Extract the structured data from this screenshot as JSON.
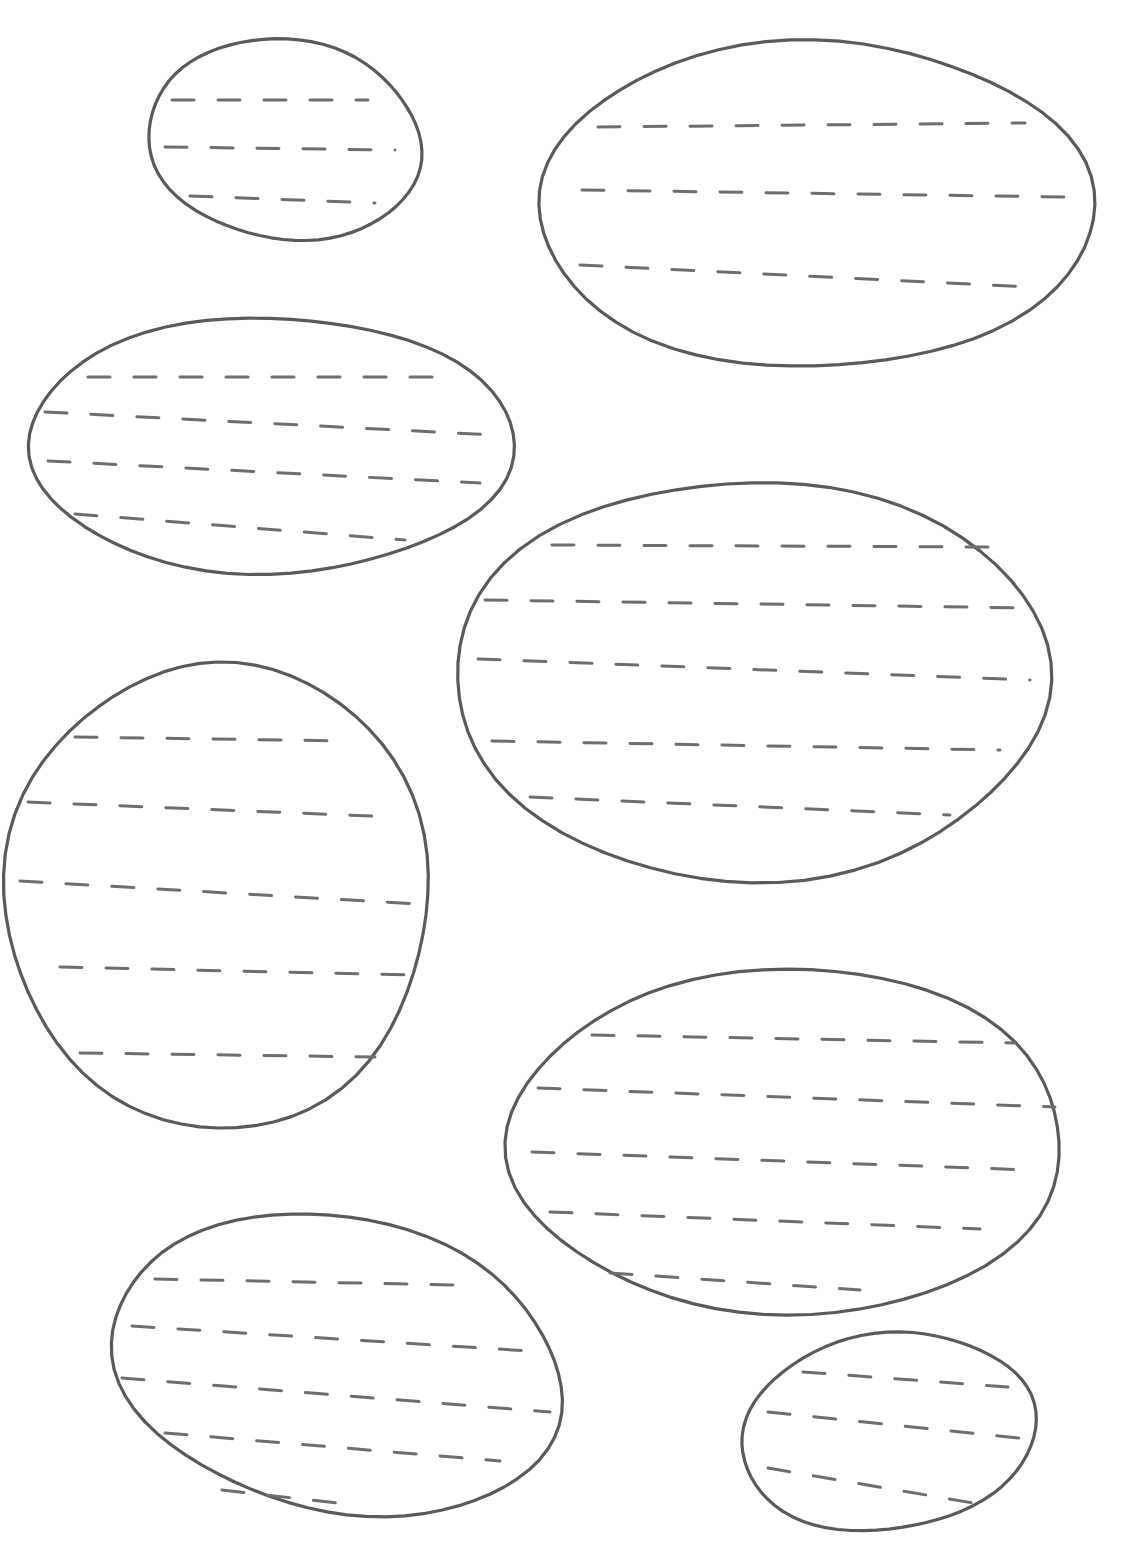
{
  "worksheet": {
    "type": "pre-writing tracing practice",
    "stroke_color": "#5a5a5a",
    "dash_color": "#6e6e6e",
    "background": "#ffffff",
    "shapes": [
      {
        "name": "oval-1",
        "cx": 285,
        "cy": 140,
        "rx": 137,
        "ry": 100,
        "rot": 8,
        "lines": [
          {
            "x1": 172,
            "y1": 100,
            "x2": 368,
            "y2": 100
          },
          {
            "x1": 165,
            "y1": 147,
            "x2": 395,
            "y2": 150
          },
          {
            "x1": 190,
            "y1": 196,
            "x2": 375,
            "y2": 203
          }
        ]
      },
      {
        "name": "oval-2",
        "cx": 815,
        "cy": 205,
        "rx": 278,
        "ry": 163,
        "rot": 0,
        "lines": [
          {
            "x1": 598,
            "y1": 127,
            "x2": 1025,
            "y2": 123
          },
          {
            "x1": 582,
            "y1": 190,
            "x2": 1065,
            "y2": 197
          },
          {
            "x1": 580,
            "y1": 265,
            "x2": 1030,
            "y2": 287
          }
        ]
      },
      {
        "name": "oval-3",
        "cx": 270,
        "cy": 445,
        "rx": 243,
        "ry": 128,
        "rot": 0,
        "lines": [
          {
            "x1": 88,
            "y1": 377,
            "x2": 450,
            "y2": 377
          },
          {
            "x1": 45,
            "y1": 412,
            "x2": 495,
            "y2": 435
          },
          {
            "x1": 48,
            "y1": 461,
            "x2": 480,
            "y2": 483
          },
          {
            "x1": 75,
            "y1": 514,
            "x2": 405,
            "y2": 540
          }
        ]
      },
      {
        "name": "oval-4",
        "cx": 752,
        "cy": 680,
        "rx": 297,
        "ry": 200,
        "rot": 0,
        "lines": [
          {
            "x1": 552,
            "y1": 545,
            "x2": 990,
            "y2": 547
          },
          {
            "x1": 485,
            "y1": 600,
            "x2": 1030,
            "y2": 608
          },
          {
            "x1": 478,
            "y1": 659,
            "x2": 1030,
            "y2": 680
          },
          {
            "x1": 492,
            "y1": 741,
            "x2": 1000,
            "y2": 750
          },
          {
            "x1": 530,
            "y1": 797,
            "x2": 950,
            "y2": 815
          }
        ]
      },
      {
        "name": "oval-5",
        "cx": 218,
        "cy": 895,
        "rx": 212,
        "ry": 233,
        "rot": 0,
        "lines": [
          {
            "x1": 75,
            "y1": 737,
            "x2": 350,
            "y2": 741
          },
          {
            "x1": 28,
            "y1": 802,
            "x2": 395,
            "y2": 817
          },
          {
            "x1": 20,
            "y1": 881,
            "x2": 418,
            "y2": 904
          },
          {
            "x1": 60,
            "y1": 967,
            "x2": 410,
            "y2": 975
          },
          {
            "x1": 80,
            "y1": 1053,
            "x2": 375,
            "y2": 1057
          }
        ]
      },
      {
        "name": "oval-6",
        "cx": 787,
        "cy": 1142,
        "rx": 277,
        "ry": 173,
        "rot": 0,
        "lines": [
          {
            "x1": 592,
            "y1": 1035,
            "x2": 1015,
            "y2": 1043
          },
          {
            "x1": 538,
            "y1": 1088,
            "x2": 1055,
            "y2": 1107
          },
          {
            "x1": 532,
            "y1": 1152,
            "x2": 1030,
            "y2": 1170
          },
          {
            "x1": 550,
            "y1": 1212,
            "x2": 980,
            "y2": 1229
          },
          {
            "x1": 610,
            "y1": 1273,
            "x2": 860,
            "y2": 1290
          }
        ]
      },
      {
        "name": "oval-7",
        "cx": 338,
        "cy": 1365,
        "rx": 228,
        "ry": 147,
        "rot": 12,
        "lines": [
          {
            "x1": 155,
            "y1": 1279,
            "x2": 455,
            "y2": 1285
          },
          {
            "x1": 132,
            "y1": 1326,
            "x2": 545,
            "y2": 1352
          },
          {
            "x1": 122,
            "y1": 1378,
            "x2": 550,
            "y2": 1412
          },
          {
            "x1": 165,
            "y1": 1433,
            "x2": 500,
            "y2": 1461
          },
          {
            "x1": 222,
            "y1": 1490,
            "x2": 355,
            "y2": 1505
          }
        ]
      },
      {
        "name": "oval-8",
        "cx": 888,
        "cy": 1432,
        "rx": 148,
        "ry": 98,
        "rot": -8,
        "lines": [
          {
            "x1": 803,
            "y1": 1372,
            "x2": 1008,
            "y2": 1387
          },
          {
            "x1": 768,
            "y1": 1412,
            "x2": 1028,
            "y2": 1439
          },
          {
            "x1": 768,
            "y1": 1468,
            "x2": 985,
            "y2": 1505
          }
        ]
      }
    ]
  }
}
